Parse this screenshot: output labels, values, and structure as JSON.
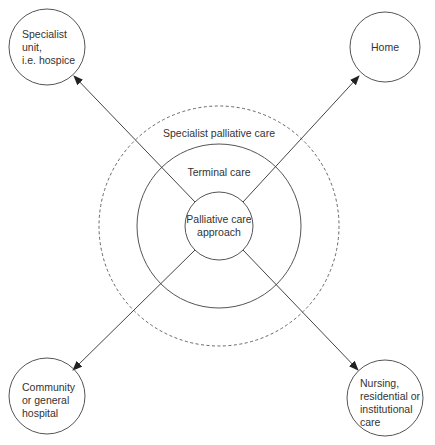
{
  "diagram": {
    "center": {
      "inner": {
        "label": "Palliative care approach",
        "line1": "Palliative care",
        "line2": "approach"
      },
      "middle": {
        "label": "Terminal care"
      },
      "outer_dashed": {
        "label": "Specialist palliative care"
      }
    },
    "destinations": [
      {
        "id": "top-left",
        "label": "Specialist unit, i.e. hospice",
        "lines": [
          "Specialist",
          "unit,",
          "i.e. hospice"
        ]
      },
      {
        "id": "top-right",
        "label": "Home",
        "lines": [
          "Home"
        ]
      },
      {
        "id": "bottom-left",
        "label": "Community or general hospital",
        "lines": [
          "Community",
          "or general",
          "hospital"
        ]
      },
      {
        "id": "bottom-right",
        "label": "Nursing, residential or institutional care",
        "lines": [
          "Nursing,",
          "residential or",
          "institutional",
          "care"
        ]
      }
    ],
    "colors": {
      "stroke": "#555555",
      "text": "#333333",
      "background": "#ffffff"
    }
  }
}
